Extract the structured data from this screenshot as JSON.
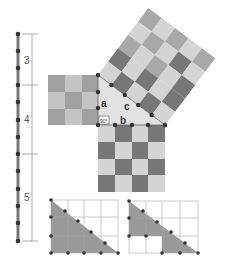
{
  "diagram": {
    "ruler_labels": [
      "3",
      "4",
      "5"
    ],
    "side_labels": {
      "a": "a",
      "b": "b",
      "c": "c"
    },
    "right_angle_label": "90°",
    "colors": {
      "dark": "#777777",
      "mid": "#a8a8a8",
      "light": "#d4d4d4",
      "triangle": "#e2e2e2",
      "dot": "#333333",
      "grid": "#999999"
    }
  }
}
